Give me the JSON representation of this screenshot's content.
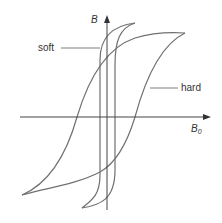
{
  "figure": {
    "type": "hysteresis-loop-diagram",
    "axes": {
      "y_label": "B",
      "x_label_base": "B",
      "x_label_sub": "0"
    },
    "curves": [
      {
        "name": "soft",
        "label": "soft"
      },
      {
        "name": "hard",
        "label": "hard"
      }
    ],
    "colors": {
      "curve": "#707070",
      "axis": "#444444",
      "text": "#333333",
      "background": "#ffffff"
    }
  }
}
